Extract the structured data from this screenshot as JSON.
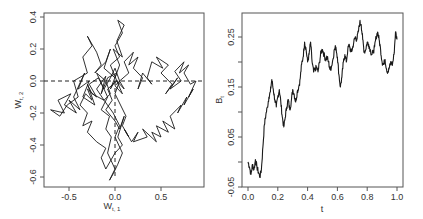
{
  "chart_data": [
    {
      "type": "line",
      "panel": "left",
      "title": "",
      "xlabel": "W_{t,1}",
      "ylabel": "W_{t,2}",
      "xlim": [
        -0.72,
        0.95
      ],
      "ylim": [
        -0.65,
        0.42
      ],
      "x_ticks": [
        -0.5,
        0.0,
        0.5
      ],
      "x_tick_labels": [
        "-0.5",
        "0.0",
        "0.5"
      ],
      "y_ticks": [
        -0.6,
        -0.4,
        -0.2,
        0.0,
        0.2,
        0.4
      ],
      "y_tick_labels": [
        "-0.6",
        "-0.4",
        "-0.2",
        "0.0",
        "0.2",
        "0.4"
      ],
      "grid": false,
      "reference_lines": [
        {
          "orientation": "horizontal",
          "value": 0.0,
          "style": "dashed"
        },
        {
          "orientation": "vertical",
          "value": 0.0,
          "style": "dashed",
          "from_y": -0.6,
          "to_y": 0.0
        }
      ],
      "description": "2D Brownian motion path (W_{t,1}, W_{t,2}) starting near origin; dense cluster around (-0.1, -0.05), excursion to upper-right cluster near (0.6, -0.05) and lower excursion to y≈-0.6",
      "series": [
        {
          "name": "path",
          "x": [
            0.0,
            -0.05,
            0.02,
            -0.08,
            -0.15,
            -0.1,
            -0.2,
            -0.12,
            -0.25,
            -0.3,
            -0.22,
            -0.35,
            -0.28,
            -0.4,
            -0.33,
            -0.45,
            -0.38,
            -0.5,
            -0.42,
            -0.55,
            -0.48,
            -0.62,
            -0.55,
            -0.7,
            -0.6,
            -0.52,
            -0.4,
            -0.45,
            -0.3,
            -0.35,
            -0.25,
            -0.3,
            -0.2,
            -0.15,
            -0.22,
            -0.1,
            -0.05,
            -0.12,
            0.0,
            0.05,
            -0.02,
            0.08,
            0.02,
            0.1,
            0.03,
            0.08,
            0.0,
            0.05,
            -0.05,
            0.02,
            -0.08,
            -0.03,
            -0.1,
            0.0,
            0.05,
            0.1,
            0.03,
            0.08,
            0.0,
            -0.05,
            -0.1,
            -0.15,
            -0.1,
            -0.2,
            -0.3,
            -0.25,
            -0.35,
            -0.3,
            -0.38,
            -0.32,
            -0.25,
            -0.3,
            -0.2,
            -0.28,
            -0.18,
            -0.12,
            -0.2,
            -0.1,
            -0.05,
            -0.12,
            -0.02,
            0.05,
            0.0,
            0.08,
            0.03,
            -0.02,
            -0.06,
            0.0,
            -0.08,
            -0.04,
            -0.1,
            -0.06,
            -0.15,
            -0.08,
            -0.12,
            -0.05,
            0.0,
            0.05,
            0.0,
            0.06,
            0.12,
            0.08,
            0.15,
            0.1,
            0.18,
            0.25,
            0.2,
            0.35,
            0.3,
            0.45,
            0.4,
            0.5,
            0.45,
            0.58,
            0.52,
            0.65,
            0.6,
            0.72,
            0.68,
            0.78,
            0.75,
            0.85,
            0.8,
            0.88,
            0.82,
            0.75,
            0.8,
            0.7,
            0.75,
            0.65,
            0.72,
            0.6,
            0.68,
            0.55,
            0.62,
            0.5,
            0.58,
            0.45,
            0.52,
            0.4,
            0.35,
            0.4,
            0.3,
            0.25,
            0.3,
            0.2,
            0.25,
            0.15,
            0.2,
            0.1,
            0.15,
            0.05,
            0.1,
            0.02,
            0.08,
            0.0,
            0.05,
            -0.05,
            0.02,
            -0.08,
            -0.02
          ],
          "y": [
            0.0,
            -0.05,
            0.05,
            0.02,
            -0.08,
            0.03,
            -0.05,
            -0.12,
            -0.08,
            -0.02,
            -0.15,
            -0.1,
            0.0,
            -0.05,
            0.05,
            -0.1,
            -0.18,
            -0.12,
            -0.2,
            -0.15,
            -0.08,
            -0.12,
            -0.2,
            -0.18,
            -0.22,
            -0.15,
            -0.1,
            0.0,
            0.05,
            0.15,
            0.22,
            0.28,
            0.18,
            0.1,
            0.05,
            0.12,
            0.2,
            0.08,
            0.02,
            0.1,
            0.2,
            0.15,
            0.25,
            0.35,
            0.38,
            0.3,
            0.22,
            0.15,
            0.1,
            0.0,
            -0.05,
            -0.12,
            -0.18,
            -0.25,
            -0.3,
            -0.22,
            -0.35,
            -0.4,
            -0.45,
            -0.5,
            -0.55,
            -0.48,
            -0.42,
            -0.38,
            -0.32,
            -0.25,
            -0.28,
            -0.2,
            -0.15,
            -0.08,
            -0.12,
            -0.05,
            -0.1,
            -0.02,
            0.02,
            -0.05,
            0.05,
            0.0,
            -0.08,
            -0.12,
            -0.2,
            -0.28,
            -0.35,
            -0.45,
            -0.52,
            -0.58,
            -0.62,
            -0.55,
            -0.45,
            -0.35,
            -0.3,
            -0.22,
            -0.18,
            -0.1,
            -0.05,
            0.02,
            0.08,
            0.0,
            -0.08,
            -0.15,
            -0.22,
            -0.28,
            -0.35,
            -0.3,
            -0.38,
            -0.32,
            -0.38,
            -0.35,
            -0.3,
            -0.38,
            -0.32,
            -0.35,
            -0.28,
            -0.32,
            -0.25,
            -0.3,
            -0.22,
            -0.15,
            -0.2,
            -0.1,
            -0.15,
            -0.05,
            -0.1,
            0.0,
            -0.02,
            0.05,
            0.1,
            0.05,
            0.12,
            0.06,
            0.0,
            -0.05,
            0.02,
            -0.08,
            -0.02,
            0.05,
            0.1,
            0.15,
            0.08,
            0.12,
            0.02,
            -0.02,
            0.05,
            -0.05,
            0.02,
            0.08,
            0.15,
            0.1,
            0.18,
            0.12,
            0.05,
            0.0,
            -0.05,
            0.0,
            -0.08,
            -0.03,
            0.0
          ]
        }
      ]
    },
    {
      "type": "line",
      "panel": "right",
      "title": "",
      "xlabel": "t",
      "ylabel": "B_t",
      "xlim": [
        -0.02,
        1.02
      ],
      "ylim": [
        -0.05,
        0.3
      ],
      "x_ticks": [
        0.0,
        0.2,
        0.4,
        0.6,
        0.8,
        1.0
      ],
      "x_tick_labels": [
        "0.0",
        "0.2",
        "0.4",
        "0.6",
        "0.8",
        "1.0"
      ],
      "y_ticks": [
        -0.05,
        0.05,
        0.15,
        0.25
      ],
      "y_tick_labels": [
        "-0.05",
        "0.05",
        "0.15",
        "0.25"
      ],
      "grid": false,
      "description": "1D Brownian motion path B_t over t in [0,1]",
      "series": [
        {
          "name": "B_t",
          "x": [
            0.0,
            0.01,
            0.02,
            0.03,
            0.04,
            0.05,
            0.06,
            0.07,
            0.08,
            0.09,
            0.1,
            0.11,
            0.12,
            0.13,
            0.14,
            0.15,
            0.16,
            0.17,
            0.18,
            0.19,
            0.2,
            0.21,
            0.22,
            0.23,
            0.24,
            0.25,
            0.26,
            0.27,
            0.28,
            0.29,
            0.3,
            0.31,
            0.32,
            0.33,
            0.34,
            0.35,
            0.36,
            0.37,
            0.38,
            0.39,
            0.4,
            0.41,
            0.42,
            0.43,
            0.44,
            0.45,
            0.46,
            0.47,
            0.48,
            0.49,
            0.5,
            0.51,
            0.52,
            0.53,
            0.54,
            0.55,
            0.56,
            0.57,
            0.58,
            0.59,
            0.6,
            0.61,
            0.62,
            0.63,
            0.64,
            0.65,
            0.66,
            0.67,
            0.68,
            0.69,
            0.7,
            0.71,
            0.72,
            0.73,
            0.74,
            0.75,
            0.76,
            0.77,
            0.78,
            0.79,
            0.8,
            0.81,
            0.82,
            0.83,
            0.84,
            0.85,
            0.86,
            0.87,
            0.88,
            0.89,
            0.9,
            0.91,
            0.92,
            0.93,
            0.94,
            0.95,
            0.96,
            0.97,
            0.98,
            0.99,
            1.0
          ],
          "values": [
            0.0,
            -0.01,
            -0.025,
            -0.005,
            -0.015,
            0.005,
            -0.01,
            -0.02,
            -0.03,
            -0.015,
            0.03,
            0.075,
            0.095,
            0.11,
            0.13,
            0.14,
            0.165,
            0.145,
            0.125,
            0.11,
            0.13,
            0.145,
            0.12,
            0.09,
            0.07,
            0.09,
            0.11,
            0.125,
            0.105,
            0.12,
            0.145,
            0.135,
            0.12,
            0.14,
            0.15,
            0.165,
            0.195,
            0.21,
            0.24,
            0.225,
            0.2,
            0.215,
            0.24,
            0.2,
            0.18,
            0.185,
            0.19,
            0.18,
            0.2,
            0.22,
            0.225,
            0.215,
            0.205,
            0.21,
            0.2,
            0.185,
            0.19,
            0.205,
            0.225,
            0.23,
            0.21,
            0.175,
            0.15,
            0.17,
            0.2,
            0.215,
            0.2,
            0.225,
            0.235,
            0.22,
            0.225,
            0.24,
            0.25,
            0.245,
            0.26,
            0.28,
            0.275,
            0.245,
            0.22,
            0.225,
            0.24,
            0.235,
            0.225,
            0.215,
            0.22,
            0.23,
            0.25,
            0.26,
            0.245,
            0.225,
            0.2,
            0.195,
            0.205,
            0.185,
            0.18,
            0.19,
            0.2,
            0.195,
            0.215,
            0.26,
            0.245
          ]
        }
      ]
    }
  ],
  "labels": {
    "left_xlabel_main": "W",
    "left_xlabel_sub": "t, 1",
    "left_ylabel_main": "W",
    "left_ylabel_sub": "t, 2",
    "right_xlabel": "t",
    "right_ylabel_main": "B",
    "right_ylabel_sub": "t"
  },
  "colors": {
    "line": "#1a1a1a",
    "axis": "#555555",
    "text": "#333333",
    "background": "#ffffff"
  }
}
